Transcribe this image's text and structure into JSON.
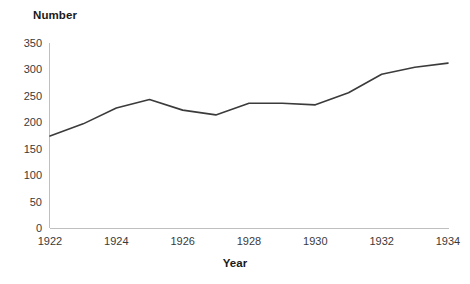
{
  "chart_data": {
    "type": "line",
    "title": "",
    "xlabel": "Year",
    "ylabel": "Number",
    "x": [
      1922,
      1923,
      1924,
      1925,
      1926,
      1927,
      1928,
      1929,
      1930,
      1931,
      1932,
      1933,
      1934
    ],
    "values": [
      174,
      197,
      227,
      243,
      223,
      214,
      236,
      236,
      233,
      256,
      291,
      304,
      312
    ],
    "series": [
      {
        "name": "Number",
        "values": [
          174,
          197,
          227,
          243,
          223,
          214,
          236,
          236,
          233,
          256,
          291,
          304,
          312
        ]
      }
    ],
    "xlim": [
      1922,
      1934
    ],
    "ylim": [
      0,
      350
    ],
    "ytick_labels": [
      "350",
      "300",
      "250",
      "200",
      "150",
      "100",
      "50",
      "0"
    ],
    "ytick_values": [
      350,
      300,
      250,
      200,
      150,
      100,
      50,
      0
    ],
    "xtick_labels": [
      "1922",
      "1924",
      "1926",
      "1928",
      "1930",
      "1932",
      "1934"
    ],
    "xtick_values": [
      1922,
      1924,
      1926,
      1928,
      1930,
      1932,
      1934
    ],
    "grid": false,
    "legend": false,
    "legend_position": "none",
    "line_color": "#3b3b3b",
    "axis_color": "#bfbfbf",
    "background_color": "#ffffff"
  },
  "axes": {
    "y_axis_title": "Number",
    "x_axis_title": "Year"
  }
}
